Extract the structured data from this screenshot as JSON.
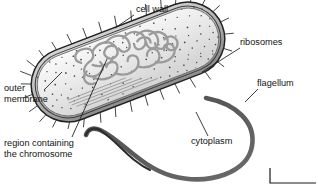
{
  "figure": {
    "background_color": "#ffffff",
    "line_color": "#1a1a1a",
    "cytoplasm_fill": "#e9e9e9",
    "wall_fill": "#b9b9b9",
    "chromosome_color": "#9a9a9a",
    "flagellum_color": "#555555",
    "ribosome_dot_color": "#4a4a4a"
  },
  "labels": [
    {
      "id": "cell-wall",
      "text": "cell wall",
      "lines": [
        "cell wall"
      ],
      "x": 136,
      "y": 12,
      "anchor": "start",
      "leader": {
        "x1": 134,
        "y1": 15,
        "x2": 115,
        "y2": 28
      }
    },
    {
      "id": "ribosomes",
      "text": "ribosomes",
      "lines": [
        "ribosomes"
      ],
      "x": 240,
      "y": 45,
      "anchor": "start",
      "leader": {
        "x1": 240,
        "y1": 48,
        "x2": 202,
        "y2": 72
      }
    },
    {
      "id": "flagellum",
      "text": "flagellum",
      "lines": [
        "flagellum"
      ],
      "x": 257,
      "y": 86,
      "anchor": "start",
      "leader": {
        "x1": 258,
        "y1": 89,
        "x2": 245,
        "y2": 102
      }
    },
    {
      "id": "outer-membrane",
      "text": "outer membrane",
      "lines": [
        "outer",
        "membrane"
      ],
      "x": 4,
      "y": 91,
      "anchor": "start",
      "leader": {
        "x1": 44,
        "y1": 90,
        "x2": 62,
        "y2": 72
      }
    },
    {
      "id": "region-containing-the-chromosome",
      "text": "region containing the chromosome",
      "lines": [
        "region containing",
        "the chromosome"
      ],
      "x": 4,
      "y": 146,
      "anchor": "start",
      "leader": {
        "x1": 72,
        "y1": 137,
        "x2": 107,
        "y2": 59
      }
    },
    {
      "id": "cytoplasm",
      "text": "cytoplasm",
      "lines": [
        "cytoplasm"
      ],
      "x": 191,
      "y": 144,
      "anchor": "start",
      "leader": {
        "x1": 208,
        "y1": 136,
        "x2": 196,
        "y2": 112
      }
    }
  ],
  "scale_bar": {
    "present": true,
    "text": "",
    "x1": 270,
    "y1": 168,
    "x2": 270,
    "y2": 183,
    "x3": 316,
    "y3": 183
  },
  "cell": {
    "shape": "capsule",
    "rotation_deg": -21,
    "center_x": 128,
    "center_y": 62,
    "length": 202,
    "width": 74,
    "pili_count": 34,
    "chromosome_loops": 14,
    "ribosome_count": 190,
    "striation_lines": 5
  },
  "flagellum": {
    "origin_x": 206,
    "origin_y": 98,
    "path": "M 206 98 C 236 104, 256 122, 252 146 C 248 172, 210 186, 172 176 C 140 167, 122 140, 100 130 C 93 127, 88 129, 86 135"
  }
}
